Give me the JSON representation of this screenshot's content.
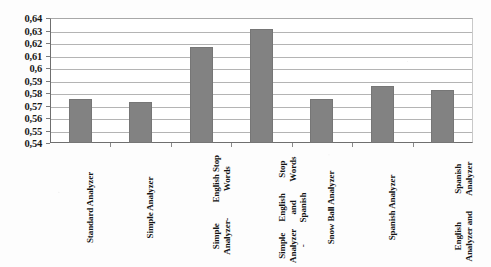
{
  "chart_data": {
    "type": "bar",
    "title": "",
    "subtitle": "",
    "xlabel": "",
    "ylabel": "",
    "ylim": [
      0.54,
      0.64
    ],
    "grid": true,
    "legend": null,
    "decimal_separator": ",",
    "bar_color": "#828282",
    "categories": [
      "Standard Analyzer",
      "Simple Analyzer",
      "Simple Analyzer-\nEnglish Stop Words",
      "Simple Analyzer -\nEnglish and Spanish\nStop Words",
      "Snow Ball Analyzer",
      "Spanish Analyzer",
      "English Analyzer and\nSpanish Analyzer"
    ],
    "values": [
      0.5755,
      0.5725,
      0.6165,
      0.6315,
      0.5755,
      0.5855,
      0.5825
    ],
    "ytick_labels": [
      "0,64",
      "0,63",
      "0,62",
      "0,61",
      "0,6",
      "0,59",
      "0,58",
      "0,57",
      "0,56",
      "0,55",
      "0,54"
    ],
    "ytick_values": [
      0.64,
      0.63,
      0.62,
      0.61,
      0.6,
      0.59,
      0.58,
      0.57,
      0.56,
      0.55,
      0.54
    ]
  }
}
